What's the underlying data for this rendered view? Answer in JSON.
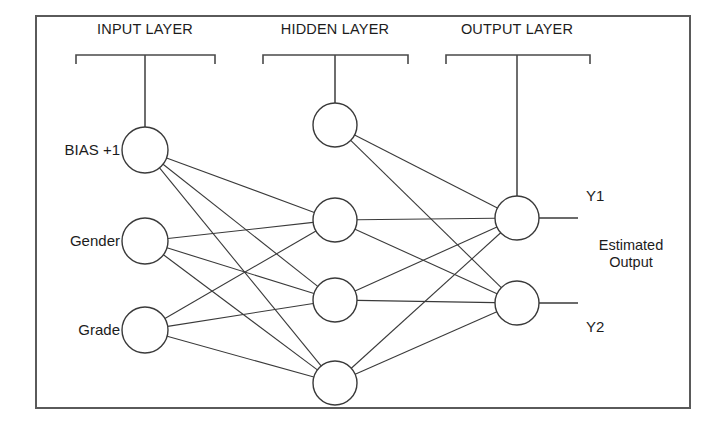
{
  "figure": {
    "type": "neural-network-diagram",
    "title_layers": [
      "INPUT LAYER",
      "HIDDEN LAYER",
      "OUTPUT LAYER"
    ],
    "stroke_color": "#3a3a3a",
    "frame_color": "#5a5a5a",
    "background": "#ffffff"
  },
  "layers": {
    "input": {
      "title": "INPUT LAYER",
      "bracket": {
        "x1": 76,
        "x2": 215,
        "y": 55,
        "tick": 9,
        "center": 145
      },
      "stem": {
        "x": 145,
        "y1": 55,
        "y2": 127
      },
      "nodes": [
        {
          "id": "bias",
          "label": "BIAS +1",
          "cx": 145,
          "cy": 150,
          "r": 23
        },
        {
          "id": "gender",
          "label": "Gender",
          "cx": 145,
          "cy": 241,
          "r": 23
        },
        {
          "id": "grade",
          "label": "Grade",
          "cx": 145,
          "cy": 330,
          "r": 23
        }
      ],
      "label_x": 120
    },
    "hidden": {
      "title": "HIDDEN LAYER",
      "bracket": {
        "x1": 263,
        "x2": 408,
        "y": 55,
        "tick": 9,
        "center": 335
      },
      "stem": {
        "x": 335,
        "y1": 55,
        "y2": 103
      },
      "nodes": [
        {
          "id": "h1",
          "cx": 335,
          "cy": 125,
          "r": 22
        },
        {
          "id": "h2",
          "cx": 335,
          "cy": 220,
          "r": 22
        },
        {
          "id": "h3",
          "cx": 335,
          "cy": 300,
          "r": 22
        },
        {
          "id": "h4",
          "cx": 335,
          "cy": 383,
          "r": 22
        }
      ]
    },
    "output": {
      "title": "OUTPUT LAYER",
      "bracket": {
        "x1": 446,
        "x2": 590,
        "y": 55,
        "tick": 9,
        "center": 517
      },
      "stem": {
        "x": 517,
        "y1": 55,
        "y2": 196
      },
      "nodes": [
        {
          "id": "o1",
          "label": "Y1",
          "cx": 517,
          "cy": 218,
          "r": 22
        },
        {
          "id": "o2",
          "label": "Y2",
          "cx": 517,
          "cy": 303,
          "r": 22
        }
      ],
      "out_line_end_x": 578,
      "y1_label_pos": {
        "x": 586,
        "y": 196
      },
      "y2_label_pos": {
        "x": 586,
        "y": 327
      },
      "estimated_output_label": "Estimated\nOutput",
      "estimated_output_line1": "Estimated",
      "estimated_output_line2": "Output",
      "estimated_pos": {
        "x": 631,
        "y": 254
      }
    }
  },
  "edges": {
    "input_to_hidden": [
      [
        "bias",
        "h2"
      ],
      [
        "bias",
        "h3"
      ],
      [
        "bias",
        "h4"
      ],
      [
        "gender",
        "h2"
      ],
      [
        "gender",
        "h3"
      ],
      [
        "gender",
        "h4"
      ],
      [
        "grade",
        "h2"
      ],
      [
        "grade",
        "h3"
      ],
      [
        "grade",
        "h4"
      ]
    ],
    "hidden_to_output": [
      [
        "h1",
        "o1"
      ],
      [
        "h1",
        "o2"
      ],
      [
        "h2",
        "o1"
      ],
      [
        "h2",
        "o2"
      ],
      [
        "h3",
        "o1"
      ],
      [
        "h3",
        "o2"
      ],
      [
        "h4",
        "o1"
      ],
      [
        "h4",
        "o2"
      ]
    ]
  },
  "frame": {
    "x": 36,
    "y": 16,
    "width": 654,
    "height": 392
  },
  "titles_y": 30
}
